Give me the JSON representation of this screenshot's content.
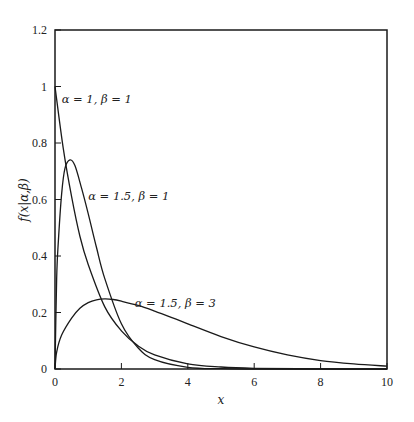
{
  "chart_data": {
    "type": "line",
    "title": "",
    "xlabel": "x",
    "ylabel": "f(x|α,β)",
    "xlim": [
      0,
      10
    ],
    "ylim": [
      0,
      1.2
    ],
    "grid": false,
    "legend": "inline annotations",
    "x_ticks": [
      "0",
      "2",
      "4",
      "6",
      "8",
      "10"
    ],
    "y_ticks": [
      "0",
      "0.2",
      "0.4",
      "0.6",
      "0.8",
      "1",
      "1.2"
    ],
    "series": [
      {
        "name": "α = 1, β = 1",
        "x": [
          0,
          0.25,
          0.5,
          0.75,
          1,
          1.5,
          2,
          2.5,
          3,
          4,
          5,
          6,
          8,
          10
        ],
        "values": [
          1.0,
          0.78,
          0.61,
          0.47,
          0.37,
          0.22,
          0.135,
          0.082,
          0.05,
          0.018,
          0.007,
          0.0025,
          0.0003,
          0.0
        ]
      },
      {
        "name": "α = 1.5, β = 1",
        "x": [
          0,
          0.05,
          0.1,
          0.2,
          0.3,
          0.45,
          0.6,
          0.8,
          1,
          1.25,
          1.5,
          2,
          2.5,
          3,
          4,
          5,
          6,
          8,
          10
        ],
        "values": [
          0,
          0.32,
          0.45,
          0.62,
          0.71,
          0.74,
          0.72,
          0.64,
          0.55,
          0.43,
          0.32,
          0.16,
          0.075,
          0.033,
          0.006,
          0.001,
          0.0,
          0.0,
          0.0
        ]
      },
      {
        "name": "α = 1.5, β = 3",
        "x": [
          0,
          0.05,
          0.2,
          0.5,
          0.75,
          1,
          1.25,
          1.5,
          1.75,
          2,
          2.5,
          3,
          3.5,
          4,
          5,
          6,
          7,
          8,
          9,
          10
        ],
        "values": [
          0,
          0.06,
          0.12,
          0.18,
          0.215,
          0.235,
          0.245,
          0.248,
          0.246,
          0.24,
          0.225,
          0.205,
          0.183,
          0.16,
          0.115,
          0.078,
          0.05,
          0.03,
          0.018,
          0.01
        ]
      }
    ],
    "annotations": [
      {
        "text": "α = 1, β = 1",
        "x": 0.2,
        "y": 0.94
      },
      {
        "text": "α = 1.5, β = 1",
        "x": 1.0,
        "y": 0.6
      },
      {
        "text": "α = 1.5, β = 3",
        "x": 2.4,
        "y": 0.22
      }
    ]
  }
}
